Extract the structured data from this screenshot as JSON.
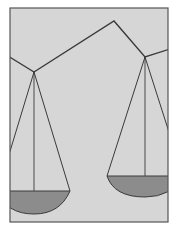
{
  "illustration": {
    "subject": "balance scale",
    "colors": {
      "page": "#ffffff",
      "panel": "#d6d6d6",
      "frame": "#555555",
      "line": "#3a3a3a",
      "pan_fill": "#8c8c8c"
    }
  }
}
